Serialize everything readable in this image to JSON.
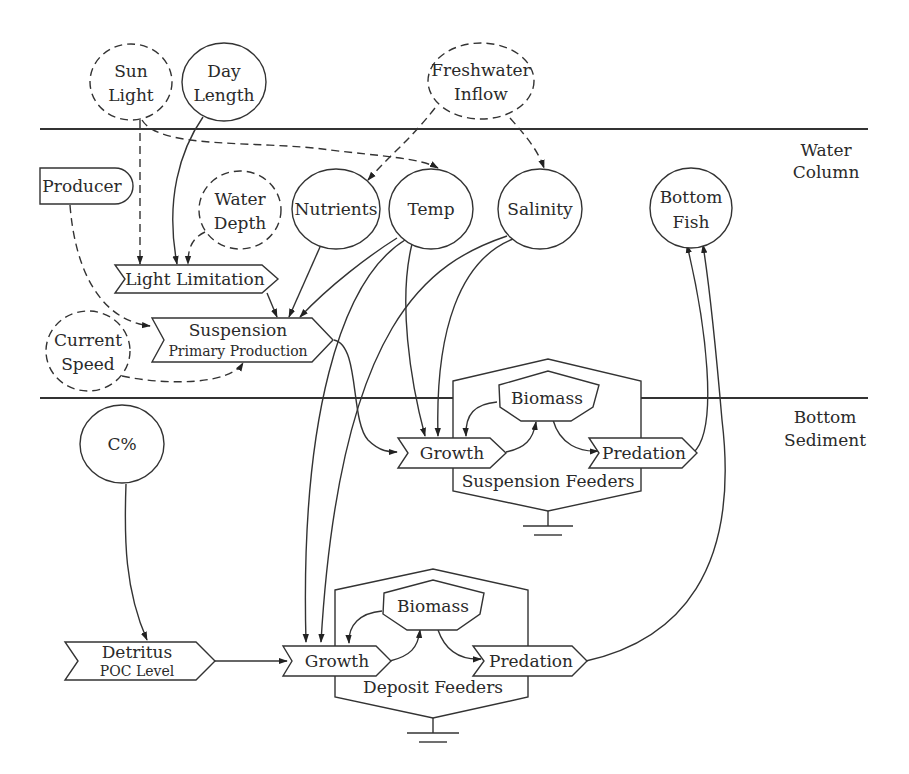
{
  "diagram": {
    "type": "ecosystem-process-flow",
    "zones": {
      "water_column": "Water Column",
      "water_column_line1": "Water",
      "water_column_line2": "Column",
      "bottom_sediment_line1": "Bottom",
      "bottom_sediment_line2": "Sediment"
    },
    "external_drivers": {
      "sun_light": {
        "line1": "Sun",
        "line2": "Light",
        "style": "dashed-circle"
      },
      "day_length": {
        "line1": "Day",
        "line2": "Length",
        "style": "solid-circle"
      },
      "freshwater_inflow": {
        "line1": "Freshwater",
        "line2": "Inflow",
        "style": "dashed-ellipse"
      }
    },
    "water_nodes": {
      "producer": "Producer",
      "water_depth": {
        "line1": "Water",
        "line2": "Depth"
      },
      "nutrients": "Nutrients",
      "temp": "Temp",
      "salinity": "Salinity",
      "bottom_fish": {
        "line1": "Bottom",
        "line2": "Fish"
      },
      "light_limitation": "Light Limitation",
      "suspension": {
        "line1": "Suspension",
        "line2": "Primary Production"
      },
      "current_speed": {
        "line1": "Current",
        "line2": "Speed"
      }
    },
    "suspension_feeders": {
      "title": "Suspension Feeders",
      "biomass": "Biomass",
      "growth": "Growth",
      "predation": "Predation"
    },
    "sediment_nodes": {
      "c_percent": "C%",
      "detritus": {
        "line1": "Detritus",
        "line2": "POC Level"
      }
    },
    "deposit_feeders": {
      "title": "Deposit Feeders",
      "biomass": "Biomass",
      "growth": "Growth",
      "predation": "Predation"
    },
    "edges": [
      {
        "from": "Sun Light",
        "to": "Light Limitation",
        "style": "dashed"
      },
      {
        "from": "Sun Light",
        "to": "Temp",
        "style": "dashed"
      },
      {
        "from": "Day Length",
        "to": "Light Limitation",
        "style": "solid"
      },
      {
        "from": "Water Depth",
        "to": "Light Limitation",
        "style": "dashed"
      },
      {
        "from": "Freshwater Inflow",
        "to": "Nutrients",
        "style": "dashed"
      },
      {
        "from": "Freshwater Inflow",
        "to": "Salinity",
        "style": "dashed"
      },
      {
        "from": "Producer",
        "to": "Suspension Primary Production",
        "style": "dashed"
      },
      {
        "from": "Current Speed",
        "to": "Suspension Primary Production",
        "style": "dashed"
      },
      {
        "from": "Light Limitation",
        "to": "Suspension Primary Production",
        "style": "solid"
      },
      {
        "from": "Nutrients",
        "to": "Suspension Primary Production",
        "style": "solid"
      },
      {
        "from": "Temp",
        "to": "Suspension Primary Production",
        "style": "solid"
      },
      {
        "from": "Suspension Primary Production",
        "to": "Growth (Suspension Feeders)",
        "style": "solid"
      },
      {
        "from": "Temp",
        "to": "Growth (Suspension Feeders)",
        "style": "solid"
      },
      {
        "from": "Salinity",
        "to": "Growth (Suspension Feeders)",
        "style": "solid"
      },
      {
        "from": "Temp",
        "to": "Growth (Deposit Feeders)",
        "style": "solid"
      },
      {
        "from": "Salinity",
        "to": "Growth (Deposit Feeders)",
        "style": "solid"
      },
      {
        "from": "Biomass (Suspension)",
        "to": "Growth (Suspension)",
        "style": "solid"
      },
      {
        "from": "Growth (Suspension)",
        "to": "Biomass (Suspension)",
        "style": "solid"
      },
      {
        "from": "Biomass (Suspension)",
        "to": "Predation (Suspension)",
        "style": "solid"
      },
      {
        "from": "Predation (Suspension)",
        "to": "Bottom Fish",
        "style": "solid"
      },
      {
        "from": "C%",
        "to": "Detritus POC Level",
        "style": "solid"
      },
      {
        "from": "Detritus POC Level",
        "to": "Growth (Deposit)",
        "style": "solid"
      },
      {
        "from": "Biomass (Deposit)",
        "to": "Growth (Deposit)",
        "style": "solid"
      },
      {
        "from": "Growth (Deposit)",
        "to": "Biomass (Deposit)",
        "style": "solid"
      },
      {
        "from": "Biomass (Deposit)",
        "to": "Predation (Deposit)",
        "style": "solid"
      },
      {
        "from": "Predation (Deposit)",
        "to": "Bottom Fish",
        "style": "solid"
      }
    ]
  }
}
